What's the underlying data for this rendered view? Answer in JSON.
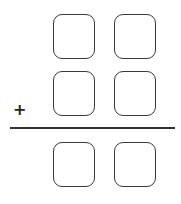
{
  "problem": {
    "operator": "+",
    "rows": [
      {
        "role": "addend-1",
        "digits": [
          "",
          ""
        ]
      },
      {
        "role": "addend-2",
        "digits": [
          "",
          ""
        ]
      },
      {
        "role": "sum",
        "digits": [
          "",
          ""
        ]
      }
    ]
  },
  "colors": {
    "border": "#3a3a3a",
    "rule": "#333333",
    "background": "#ffffff"
  }
}
